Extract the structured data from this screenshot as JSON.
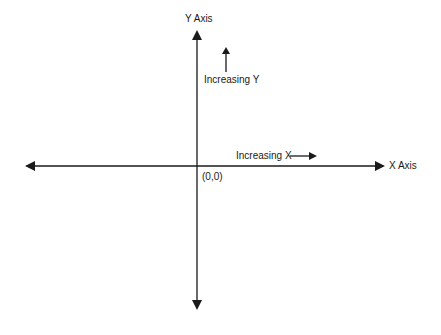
{
  "diagram": {
    "y_axis_label": "Y Axis",
    "x_axis_label": "X Axis",
    "origin_label": "(0,0)",
    "increasing_y_label": "Increasing Y",
    "increasing_x_label": "Increasing X",
    "line_color": "#1a1a1a"
  }
}
